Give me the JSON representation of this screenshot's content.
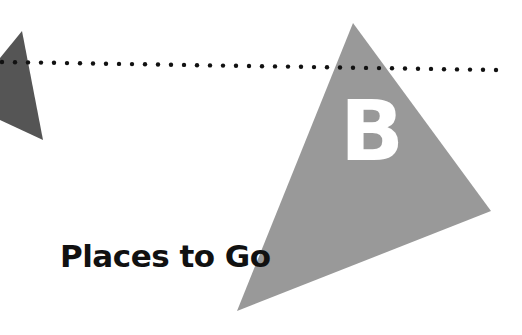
{
  "section": {
    "letter": "B",
    "title": "Places to Go"
  },
  "colors": {
    "large_triangle": "#999999",
    "small_triangle": "#555555",
    "dots": "#111111",
    "letter": "#ffffff",
    "title": "#111111",
    "background": "#ffffff"
  },
  "decorations": {
    "dotted_line": {
      "x1": 0,
      "y1": 62,
      "x2": 494,
      "y2": 70,
      "dot_spacing": 13
    },
    "large_triangle": [
      [
        353,
        23
      ],
      [
        491,
        211
      ],
      [
        237,
        311
      ]
    ],
    "small_triangle": [
      [
        22,
        31
      ],
      [
        43,
        140
      ],
      [
        0,
        120
      ],
      [
        0,
        58
      ]
    ]
  }
}
